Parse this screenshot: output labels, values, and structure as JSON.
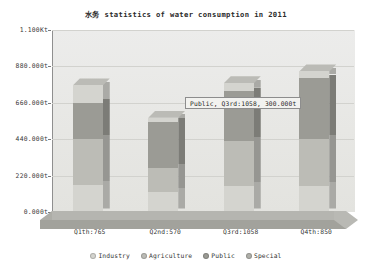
{
  "chart_data": {
    "type": "bar",
    "subtype": "stacked-column-3d",
    "title": "水务 statistics of water consumption in  2011",
    "xlabel": "",
    "ylabel": "",
    "ylim": [
      0,
      1100
    ],
    "grid": true,
    "legend_position": "bottom",
    "categories": [
      "Q1th:765",
      "Q2nd:570",
      "Q3rd:1058",
      "Q4th:850"
    ],
    "ytick_labels": [
      "1.100Kt",
      "880.000t",
      "660.000t",
      "440.000t",
      "220.000t",
      "0.000t"
    ],
    "ytick_values": [
      1100,
      880,
      660,
      440,
      220,
      0
    ],
    "unit": "t",
    "series": [
      {
        "name": "Industry",
        "color": "#d4d4cf",
        "values": [
          165,
          120,
          155,
          160
        ]
      },
      {
        "name": "Agriculture",
        "color": "#bcbcb6",
        "values": [
          275,
          145,
          275,
          280
        ]
      },
      {
        "name": "Public",
        "color": "#9b9b95",
        "values": [
          220,
          280,
          300,
          370
        ]
      },
      {
        "name": "Special",
        "color": "#d4d4cf",
        "values": [
          105,
          25,
          48,
          40
        ]
      }
    ],
    "totals": [
      765,
      570,
      1058,
      850
    ],
    "annotation": {
      "label": "Public, Q3rd:1058, 300.000t",
      "series": "Public",
      "category": "Q3rd:1058",
      "value": "300.000t"
    }
  },
  "legend": {
    "items": [
      {
        "label": "Industry",
        "swatch": "#d4d4cf"
      },
      {
        "label": "Agriculture",
        "swatch": "#bcbcb6"
      },
      {
        "label": "Public",
        "swatch": "#9b9b95"
      },
      {
        "label": "Special",
        "swatch": "#b0b0aa"
      }
    ]
  },
  "colors": {
    "plot_background": "#e9e9e6",
    "gridline": "#d2d2ce",
    "floor_top": "#b5b5b0",
    "floor_front": "#a2a29c",
    "axis": "#8f8f8f",
    "text": "#333333",
    "tooltip_bg": "#f2f2ef",
    "tooltip_border": "#8d8d8d"
  }
}
